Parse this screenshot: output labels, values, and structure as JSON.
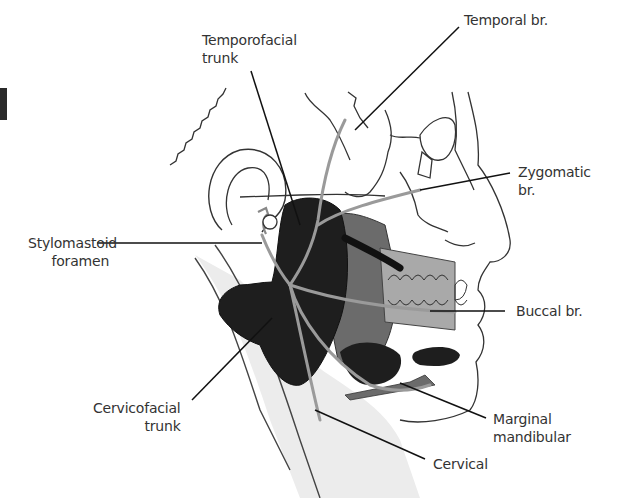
{
  "figure": {
    "colors": {
      "outline": "#333333",
      "parotid_dark": "#1e1e1e",
      "masseter_grey": "#6b6b6b",
      "buccal_fat_light": "#a9a9a9",
      "neck_light": "#ececec",
      "nerve": "#9a9a9a",
      "leader": "#111111"
    },
    "labels": {
      "temporofacial": {
        "line1": "Temporofacial",
        "line2": "trunk"
      },
      "temporal": {
        "line1": "Temporal br."
      },
      "stylomastoid": {
        "line1": "Stylomastoid",
        "line2": "foramen"
      },
      "zygomatic": {
        "line1": "Zygomatic",
        "line2": "br."
      },
      "buccal": {
        "line1": "Buccal br."
      },
      "cervicofacial": {
        "line1": "Cervicofacial",
        "line2": "trunk"
      },
      "marginal_mandibular": {
        "line1": "Marginal",
        "line2": "mandibular"
      },
      "cervical": {
        "line1": "Cervical"
      }
    }
  }
}
